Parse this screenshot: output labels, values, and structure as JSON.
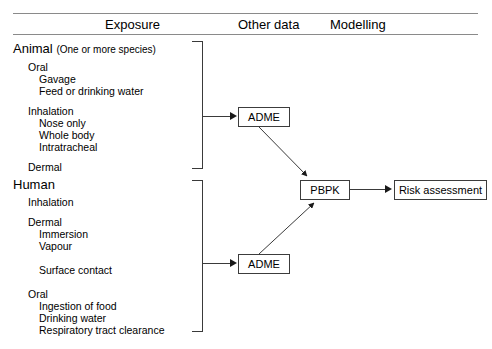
{
  "figure": {
    "headers": [
      {
        "key": "exposure",
        "label": "Exposure"
      },
      {
        "key": "other_data",
        "label": "Other data"
      },
      {
        "key": "modelling",
        "label": "Modelling"
      }
    ],
    "groups": [
      {
        "key": "animal",
        "title": "Animal",
        "subtitle": "(One or more species)",
        "items": [
          {
            "label": "Oral",
            "level": 1
          },
          {
            "label": "Gavage",
            "level": 2
          },
          {
            "label": "Feed or drinking water",
            "level": 2
          },
          {
            "label": "Inhalation",
            "level": 1
          },
          {
            "label": "Nose only",
            "level": 2
          },
          {
            "label": "Whole body",
            "level": 2
          },
          {
            "label": "Intratracheal",
            "level": 2
          },
          {
            "label": "Dermal",
            "level": 1
          }
        ]
      },
      {
        "key": "human",
        "title": "Human",
        "subtitle": "",
        "items": [
          {
            "label": "Inhalation",
            "level": 1
          },
          {
            "label": "Dermal",
            "level": 1
          },
          {
            "label": "Immersion",
            "level": 2
          },
          {
            "label": "Vapour",
            "level": 2
          },
          {
            "label": "Surface contact",
            "level": 2
          },
          {
            "label": "Oral",
            "level": 1
          },
          {
            "label": "Ingestion of food",
            "level": 2
          },
          {
            "label": "Drinking water",
            "level": 2
          },
          {
            "label": "Respiratory tract clearance",
            "level": 2
          }
        ]
      }
    ],
    "nodes": [
      {
        "key": "adme_animal",
        "label": "ADME"
      },
      {
        "key": "adme_human",
        "label": "ADME"
      },
      {
        "key": "pbpk",
        "label": "PBPK"
      },
      {
        "key": "risk_assessment",
        "label": "Risk assessment"
      }
    ],
    "edges": [
      {
        "from": "animal_bracket",
        "to": "adme_animal",
        "style": "straight"
      },
      {
        "from": "human_bracket",
        "to": "adme_human",
        "style": "straight"
      },
      {
        "from": "adme_animal",
        "to": "pbpk",
        "style": "diagonal"
      },
      {
        "from": "adme_human",
        "to": "pbpk",
        "style": "diagonal"
      },
      {
        "from": "pbpk",
        "to": "risk_assessment",
        "style": "straight"
      }
    ],
    "colors": {
      "line": "#3a3a3a",
      "rule": "#8a8a8a",
      "text": "#000000",
      "background": "#ffffff"
    }
  }
}
